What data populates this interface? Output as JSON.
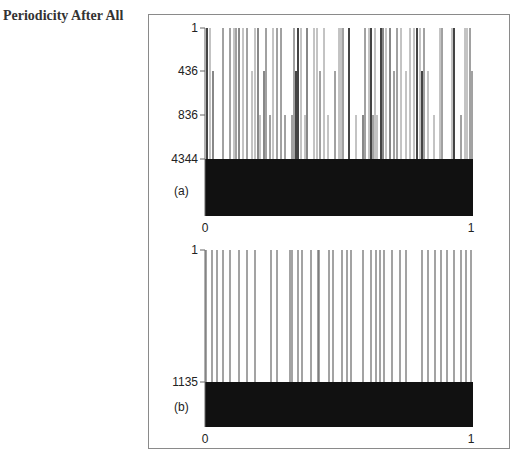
{
  "heading": "Periodicity After All",
  "chart_data": [
    {
      "type": "bar",
      "panel_label": "(a)",
      "description": "Barcode-style binary sequence plot: vertical lines of varying heights indicating periodic rows; solid block below 4344",
      "x_ticks": [
        "0",
        "1"
      ],
      "y_ticks": [
        "1",
        "436",
        "836",
        "4344"
      ],
      "xlim": [
        0,
        1
      ],
      "y_levels": [
        1,
        436,
        836,
        4344
      ],
      "fill_color": "#111111",
      "line_color": "#555555"
    },
    {
      "type": "bar",
      "panel_label": "(b)",
      "description": "Barcode-style sequence plot: sparse vertical lines from 1 to 1135 with solid block below 1135",
      "x_ticks": [
        "0",
        "1"
      ],
      "y_ticks": [
        "1",
        "1135"
      ],
      "xlim": [
        0,
        1
      ],
      "y_levels": [
        1,
        1135
      ],
      "fill_color": "#111111",
      "line_color": "#555555"
    }
  ],
  "panel_a": {
    "label": "(a)",
    "y_tick_1": "1",
    "y_tick_2": "436",
    "y_tick_3": "836",
    "y_tick_4": "4344",
    "x_tick_0": "0",
    "x_tick_1": "1"
  },
  "panel_b": {
    "label": "(b)",
    "y_tick_1": "1",
    "y_tick_2": "1135",
    "x_tick_0": "0",
    "x_tick_1": "1"
  }
}
